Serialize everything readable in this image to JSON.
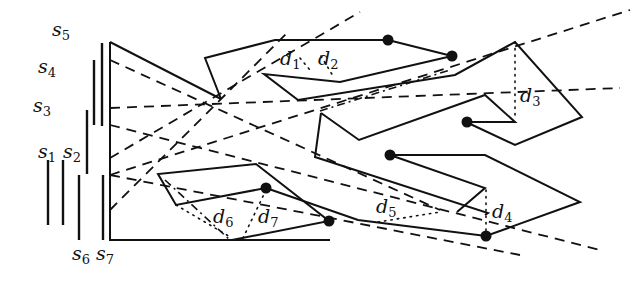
{
  "figure": {
    "segment_labels": [
      {
        "id": "s5",
        "base": "s",
        "sub": "5",
        "x": 52,
        "y": 36
      },
      {
        "id": "s4",
        "base": "s",
        "sub": "4",
        "x": 38,
        "y": 73
      },
      {
        "id": "s3",
        "base": "s",
        "sub": "3",
        "x": 33,
        "y": 112
      },
      {
        "id": "s1",
        "base": "s",
        "sub": "1",
        "x": 38,
        "y": 158
      },
      {
        "id": "s2",
        "base": "s",
        "sub": "2",
        "x": 63,
        "y": 158
      },
      {
        "id": "s6",
        "base": "s",
        "sub": "6",
        "x": 72,
        "y": 260
      },
      {
        "id": "s7",
        "base": "s",
        "sub": "7",
        "x": 96,
        "y": 260
      }
    ],
    "distance_labels": [
      {
        "id": "d1",
        "base": "d",
        "sub": "1",
        "x": 280,
        "y": 65
      },
      {
        "id": "d2",
        "base": "d",
        "sub": "2",
        "x": 318,
        "y": 65
      },
      {
        "id": "d3",
        "base": "d",
        "sub": "3",
        "x": 520,
        "y": 102
      },
      {
        "id": "d4",
        "base": "d",
        "sub": "4",
        "x": 492,
        "y": 218
      },
      {
        "id": "d5",
        "base": "d",
        "sub": "5",
        "x": 376,
        "y": 213
      },
      {
        "id": "d6",
        "base": "d",
        "sub": "6",
        "x": 213,
        "y": 223
      },
      {
        "id": "d7",
        "base": "d",
        "sub": "7",
        "x": 258,
        "y": 223
      }
    ],
    "vertical_segments": [
      {
        "id": "s1",
        "x": 48,
        "y1": 160,
        "y2": 225
      },
      {
        "id": "s2",
        "x": 64,
        "y1": 160,
        "y2": 225
      },
      {
        "id": "s6",
        "x": 80,
        "y1": 175,
        "y2": 240
      },
      {
        "id": "s3",
        "x": 87,
        "y1": 110,
        "y2": 175
      },
      {
        "id": "s4",
        "x": 95,
        "y1": 60,
        "y2": 125
      },
      {
        "id": "s7",
        "x": 103,
        "y1": 175,
        "y2": 240
      },
      {
        "id": "s5",
        "x": 103,
        "y1": 44,
        "y2": 125
      }
    ],
    "endpoints": [
      {
        "x": 388,
        "y": 40
      },
      {
        "x": 452,
        "y": 56
      },
      {
        "x": 467,
        "y": 122
      },
      {
        "x": 390,
        "y": 155
      },
      {
        "x": 266,
        "y": 188
      },
      {
        "x": 329,
        "y": 221
      },
      {
        "x": 486,
        "y": 236
      }
    ]
  }
}
